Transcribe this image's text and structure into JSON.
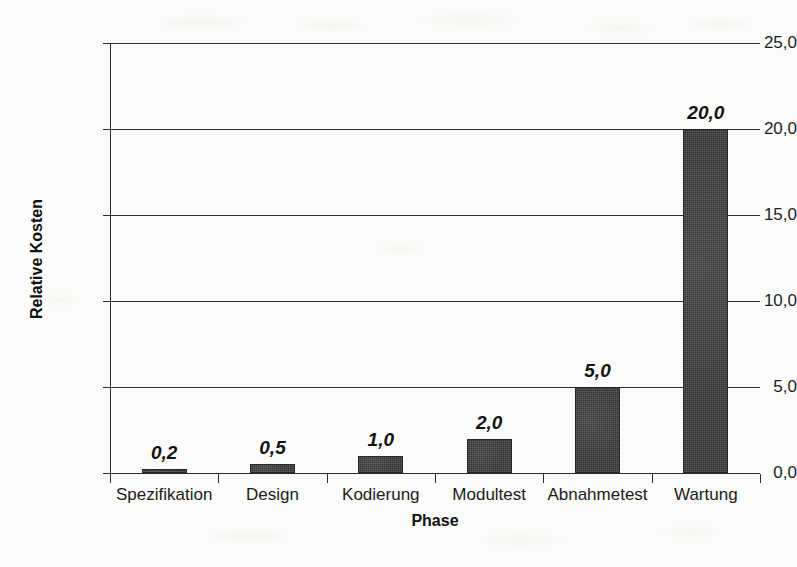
{
  "chart_data": {
    "type": "bar",
    "title": "",
    "subtitle": "",
    "xlabel": "Phase",
    "ylabel": "Relative Kosten",
    "categories": [
      "Spezifikation",
      "Design",
      "Kodierung",
      "Modultest",
      "Abnahmetest",
      "Wartung"
    ],
    "values": [
      0.2,
      0.5,
      1.0,
      2.0,
      5.0,
      20.0
    ],
    "value_labels": [
      "0,2",
      "0,5",
      "1,0",
      "2,0",
      "5,0",
      "20,0"
    ],
    "ylim": [
      0,
      25
    ],
    "ytick_values": [
      0,
      5,
      10,
      15,
      20,
      25
    ],
    "ytick_labels": [
      "0,0",
      "5,0",
      "10,0",
      "15,0",
      "20,0",
      "25,0"
    ],
    "grid": true,
    "grid_axis": "y",
    "legend": false,
    "legend_position": "none",
    "bar_color": "#3b3b3b",
    "axis_color": "#2c2c2c",
    "background_color": "#fbfbf9",
    "decimal_separator": ","
  }
}
